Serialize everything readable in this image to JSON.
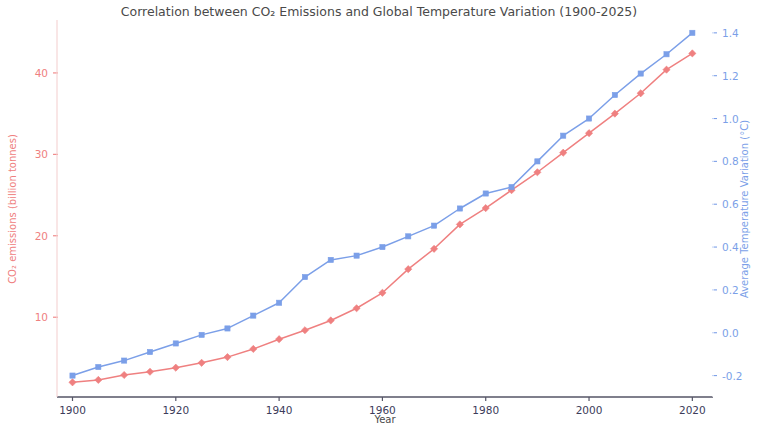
{
  "chart_data": {
    "type": "line",
    "title": "Correlation between CO₂ Emissions and Global Temperature Variation (1900-2025)",
    "xlabel": "Year",
    "ylabel": "CO₂ emissions (billion tonnes)",
    "ylabel_right": "Average Temperature Variation (°C)",
    "grid": false,
    "legend": "none",
    "xlim": [
      1897,
      2024
    ],
    "ylim": [
      0.2,
      46.5
    ],
    "ylim_right": [
      -0.3,
      1.46
    ],
    "xticks": [
      1900,
      1920,
      1940,
      1960,
      1980,
      2000,
      2020
    ],
    "xtick_labels": [
      "1900",
      "1920",
      "1940",
      "1960",
      "1980",
      "2000",
      "2020"
    ],
    "yticks_left": [
      10,
      20,
      30,
      40
    ],
    "ytick_labels_left": [
      "10",
      "20",
      "30",
      "40"
    ],
    "yticks_right": [
      -0.2,
      0.0,
      0.2,
      0.4,
      0.6,
      0.8,
      1.0,
      1.2,
      1.4
    ],
    "ytick_labels_right": [
      "-0.2",
      "0.0",
      "0.2",
      "0.4",
      "0.6",
      "0.8",
      "1.0",
      "1.2",
      "1.4"
    ],
    "x": [
      1900,
      1905,
      1910,
      1915,
      1920,
      1925,
      1930,
      1935,
      1940,
      1945,
      1950,
      1955,
      1960,
      1965,
      1970,
      1975,
      1980,
      1985,
      1990,
      1995,
      2000,
      2005,
      2010,
      2015,
      2020
    ],
    "series": [
      {
        "name": "CO₂ emissions (billion tonnes)",
        "axis": "left",
        "color": "#ef8080",
        "marker": "diamond",
        "values": [
          2.0,
          2.3,
          2.9,
          3.3,
          3.8,
          4.4,
          5.1,
          6.1,
          7.3,
          8.4,
          9.6,
          11.1,
          13.0,
          15.9,
          18.4,
          21.4,
          23.4,
          25.6,
          27.8,
          30.2,
          32.6,
          35.0,
          37.5,
          40.4,
          42.4
        ]
      },
      {
        "name": "Average Temperature Variation (°C)",
        "axis": "right",
        "color": "#7b9fe8",
        "marker": "square",
        "values": [
          -0.2,
          -0.16,
          -0.13,
          -0.09,
          -0.05,
          -0.01,
          0.02,
          0.08,
          0.14,
          0.26,
          0.34,
          0.36,
          0.4,
          0.45,
          0.5,
          0.58,
          0.65,
          0.68,
          0.8,
          0.92,
          1.0,
          1.11,
          1.21,
          1.3,
          1.4
        ]
      }
    ]
  },
  "colors": {
    "left_axis": "#ef8080",
    "right_axis": "#7b9fe8",
    "title_text": "#4a4a4a",
    "tick_text": "#3c3c5a",
    "spine": "#555566",
    "background": "#ffffff"
  }
}
